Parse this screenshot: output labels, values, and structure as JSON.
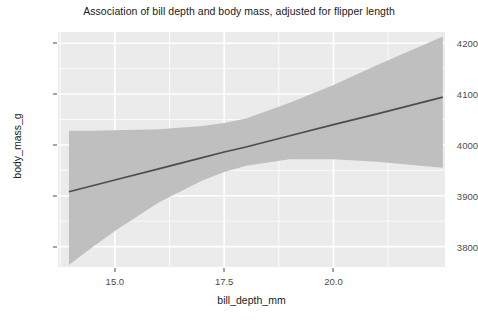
{
  "chart_data": {
    "type": "line",
    "title": "Association of bill depth and body mass, adjusted for flipper length",
    "xlabel": "bill_depth_mm",
    "ylabel": "body_mass_g",
    "xlim": [
      13.7,
      22.55
    ],
    "ylim": [
      3760,
      4222
    ],
    "xticks": [
      15.0,
      17.5,
      20.0
    ],
    "xtick_labels": [
      "15.0",
      "17.5",
      "20.0"
    ],
    "yticks": [
      3800,
      3900,
      4000,
      4100,
      4200
    ],
    "ytick_labels": [
      "3800",
      "3900",
      "4000",
      "4100",
      "4200"
    ],
    "x_minor_ticks": [
      13.75,
      16.25,
      18.75,
      21.25
    ],
    "y_minor_ticks": [
      3750,
      3850,
      3950,
      4050,
      4150,
      4250
    ],
    "grid": true,
    "legend": "none",
    "series": [
      {
        "name": "fitted line",
        "kind": "line",
        "color": "#4d4d4d",
        "x": [
          13.95,
          15.0,
          16.0,
          17.0,
          17.5,
          18.0,
          19.0,
          20.0,
          21.0,
          22.5
        ],
        "y": [
          3908,
          3931,
          3953,
          3975,
          3986,
          3996,
          4018,
          4040,
          4061,
          4094
        ]
      },
      {
        "name": "confidence ribbon",
        "kind": "ribbon",
        "color": "#bfbfbf",
        "x": [
          13.95,
          14.5,
          15.0,
          16.0,
          17.0,
          17.5,
          18.0,
          19.0,
          20.0,
          21.0,
          22.5
        ],
        "ymin": [
          3764,
          3800,
          3831,
          3887,
          3930,
          3947,
          3959,
          3972,
          3972,
          3967,
          3955
        ],
        "ymax": [
          4028,
          4028,
          4029,
          4031,
          4037,
          4043,
          4052,
          4083,
          4118,
          4157,
          4213
        ]
      }
    ],
    "panel_background": "#ebebeb",
    "grid_color": "#ffffff",
    "line_color": "#4d4d4d",
    "ribbon_color": "#bfbfbf",
    "text_color": "#1a1a1a",
    "tick_text_color": "#4d4d4d"
  }
}
